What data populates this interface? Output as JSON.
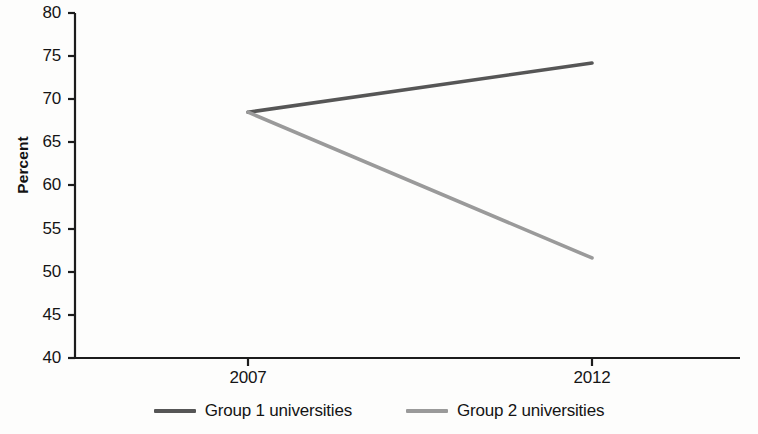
{
  "chart_data": {
    "type": "line",
    "title": "",
    "subtitle": "",
    "xlabel": "",
    "ylabel": "Percent",
    "x": [
      "2007",
      "2012"
    ],
    "xtick_labels": [
      "2007",
      "2012"
    ],
    "ytick_labels": [
      "40",
      "45",
      "50",
      "55",
      "60",
      "65",
      "70",
      "75",
      "80"
    ],
    "ylim": [
      40,
      80
    ],
    "ytick_step": 5,
    "grid": false,
    "legend_position": "bottom-center",
    "series": [
      {
        "name": "Group 1 universities",
        "values": [
          68.5,
          74.2
        ],
        "color": "#565656"
      },
      {
        "name": "Group 2 universities",
        "values": [
          68.5,
          51.6
        ],
        "color": "#9a9a9a"
      }
    ]
  },
  "axis": {
    "ylabel": "Percent",
    "yticks": [
      "80",
      "75",
      "70",
      "65",
      "60",
      "55",
      "50",
      "45",
      "40"
    ],
    "xticks": [
      "2007",
      "2012"
    ],
    "axis_color": "#1c1c1c"
  },
  "legend": {
    "entries": [
      {
        "label": "Group 1 universities",
        "color": "#565656"
      },
      {
        "label": "Group 2 universities",
        "color": "#9a9a9a"
      }
    ]
  }
}
